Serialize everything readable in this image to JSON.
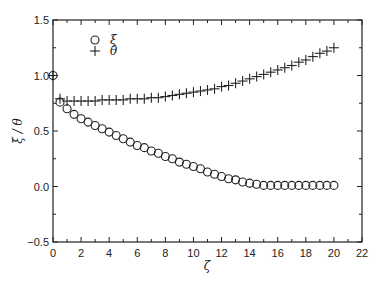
{
  "chart_data": {
    "type": "scatter",
    "title": "",
    "xlabel": "ζ",
    "ylabel": "ξ / θ",
    "xlim": [
      0,
      22
    ],
    "ylim": [
      -0.5,
      1.5
    ],
    "xticks": [
      0,
      2,
      4,
      6,
      8,
      10,
      12,
      14,
      16,
      18,
      20,
      22
    ],
    "yticks": [
      -0.5,
      0.0,
      0.5,
      1.0,
      1.5
    ],
    "ytick_labels": [
      "−0.5",
      "0.0",
      "0.5",
      "1.0",
      "1.5"
    ],
    "grid": false,
    "legend_position": "upper-left",
    "series": [
      {
        "name": "ξ",
        "marker": "circle-open",
        "x": [
          0,
          0.5,
          1,
          1.5,
          2,
          2.5,
          3,
          3.5,
          4,
          4.5,
          5,
          5.5,
          6,
          6.5,
          7,
          7.5,
          8,
          8.5,
          9,
          9.5,
          10,
          10.5,
          11,
          11.5,
          12,
          12.5,
          13,
          13.5,
          14,
          14.5,
          15,
          15.5,
          16,
          16.5,
          17,
          17.5,
          18,
          18.5,
          19,
          19.5,
          20
        ],
        "values": [
          1.0,
          0.76,
          0.7,
          0.65,
          0.61,
          0.58,
          0.55,
          0.52,
          0.49,
          0.46,
          0.43,
          0.4,
          0.37,
          0.35,
          0.32,
          0.3,
          0.27,
          0.25,
          0.22,
          0.2,
          0.18,
          0.16,
          0.13,
          0.11,
          0.09,
          0.07,
          0.06,
          0.04,
          0.03,
          0.02,
          0.01,
          0.01,
          0.01,
          0.01,
          0.01,
          0.01,
          0.01,
          0.01,
          0.01,
          0.01,
          0.01
        ]
      },
      {
        "name": "θ",
        "marker": "plus",
        "x": [
          0,
          0.5,
          1,
          1.5,
          2,
          2.5,
          3,
          3.5,
          4,
          4.5,
          5,
          5.5,
          6,
          6.5,
          7,
          7.5,
          8,
          8.5,
          9,
          9.5,
          10,
          10.5,
          11,
          11.5,
          12,
          12.5,
          13,
          13.5,
          14,
          14.5,
          15,
          15.5,
          16,
          16.5,
          17,
          17.5,
          18,
          18.5,
          19,
          19.5,
          20
        ],
        "values": [
          1.0,
          0.79,
          0.77,
          0.77,
          0.77,
          0.77,
          0.77,
          0.78,
          0.78,
          0.78,
          0.78,
          0.79,
          0.79,
          0.79,
          0.8,
          0.8,
          0.81,
          0.82,
          0.83,
          0.84,
          0.85,
          0.86,
          0.87,
          0.88,
          0.9,
          0.91,
          0.93,
          0.95,
          0.97,
          0.99,
          1.01,
          1.03,
          1.05,
          1.07,
          1.09,
          1.12,
          1.14,
          1.17,
          1.2,
          1.22,
          1.25
        ]
      }
    ]
  }
}
